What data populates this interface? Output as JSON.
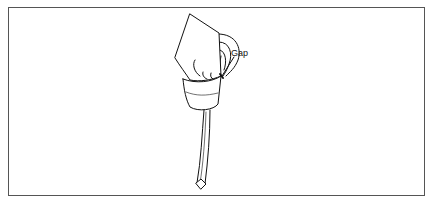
{
  "figure": {
    "labels": {
      "gap": "Gap"
    },
    "colors": {
      "line": "#111111",
      "frame": "#555555",
      "background": "#ffffff"
    }
  }
}
